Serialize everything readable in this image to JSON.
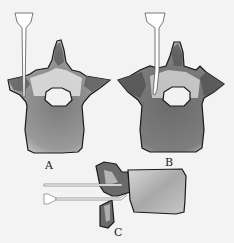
{
  "figure": {
    "panels": [
      {
        "id": "A",
        "label": "A",
        "view": "axial vertebra with transpedicular needle"
      },
      {
        "id": "B",
        "label": "B",
        "view": "axial vertebra with needle"
      },
      {
        "id": "C",
        "label": "C",
        "view": "lateral vertebra with two needles"
      }
    ]
  },
  "colors": {
    "background": "#f3f3f3",
    "outline": "#1a1a1a",
    "bone_dark": "#555555",
    "bone_mid": "#8a8a8a",
    "bone_light": "#e8e8e8",
    "needle": "#ffffff"
  }
}
